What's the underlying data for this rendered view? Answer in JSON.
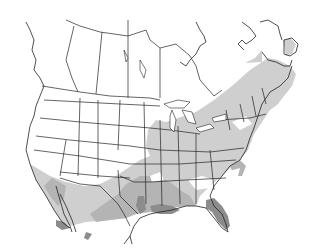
{
  "map": {
    "region": "North America (Canada, United States, northern Mexico)",
    "type": "species range map",
    "colors": {
      "background": "#ffffff",
      "land": "#ffffff",
      "range_light": "#cfcfcf",
      "range_medium": "#b4b4b4",
      "range_dark": "#8c8c8c",
      "borders": "#222222"
    },
    "legend": []
  }
}
